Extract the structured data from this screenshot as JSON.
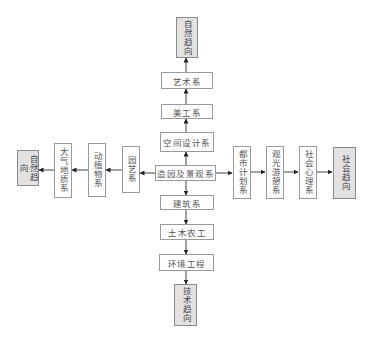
{
  "diagram": {
    "center": "造园及景观系",
    "up_chain": [
      "空间设计系",
      "美工系",
      "艺术系"
    ],
    "up_trend": "自然趋向",
    "down_chain": [
      "建筑系",
      "土木农工",
      "环境工程"
    ],
    "down_trend": "技术趋向",
    "left_chain": [
      "园艺系",
      "动植物系",
      "大气地质系"
    ],
    "left_trend": "自然趋向",
    "right_chain": [
      "都市计划系",
      "观光游憩系",
      "社会心理系"
    ],
    "right_trend": "社会趋向",
    "colors": {
      "box_border": "#9a9a9a",
      "trend_fill": "#e2e2e2",
      "text": "#555555",
      "arrow": "#222222"
    }
  }
}
